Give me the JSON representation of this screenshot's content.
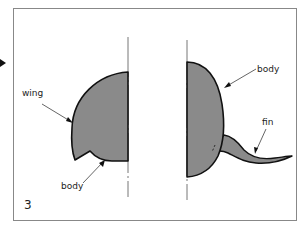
{
  "figure": {
    "panel_number": "3",
    "colors": {
      "fill": "#8a8a8a",
      "outline": "#111111",
      "frame": "#888888",
      "axis": "#777777"
    },
    "left_shape": {
      "labels": {
        "wing": "wing",
        "body": "body"
      }
    },
    "right_shape": {
      "labels": {
        "body": "body",
        "fin": "fin"
      }
    },
    "icons": {
      "pointer": "arrow-right-marker"
    }
  }
}
